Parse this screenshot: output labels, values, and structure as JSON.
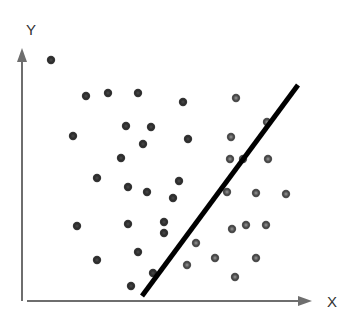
{
  "chart_data": {
    "type": "scatter",
    "title": "",
    "xlabel": "X",
    "ylabel": "Y",
    "grid": false,
    "legend": null,
    "colors": {
      "axis": "#6e6e6e",
      "point_class_a": "#2e2e2e",
      "point_class_b": "#4a4a4a",
      "separator_line": "#000000"
    },
    "series": [
      {
        "name": "class-a (left of line)",
        "points_px": [
          [
            51,
            60
          ],
          [
            86,
            96
          ],
          [
            108,
            93
          ],
          [
            138,
            93
          ],
          [
            183,
            102
          ],
          [
            73,
            136
          ],
          [
            126,
            126
          ],
          [
            151,
            127
          ],
          [
            188,
            139
          ],
          [
            143,
            144
          ],
          [
            121,
            158
          ],
          [
            97,
            178
          ],
          [
            128,
            187
          ],
          [
            147,
            192
          ],
          [
            179,
            181
          ],
          [
            173,
            198
          ],
          [
            77,
            226
          ],
          [
            128,
            224
          ],
          [
            164,
            222
          ],
          [
            164,
            233
          ],
          [
            97,
            260
          ],
          [
            138,
            252
          ],
          [
            153,
            273
          ],
          [
            131,
            286
          ]
        ]
      },
      {
        "name": "class-b (right of line)",
        "points_px": [
          [
            236,
            98
          ],
          [
            267,
            122
          ],
          [
            231,
            137
          ],
          [
            230,
            159
          ],
          [
            243,
            159
          ],
          [
            268,
            159
          ],
          [
            227,
            192
          ],
          [
            256,
            193
          ],
          [
            286,
            194
          ],
          [
            232,
            229
          ],
          [
            246,
            225
          ],
          [
            266,
            225
          ],
          [
            196,
            243
          ],
          [
            187,
            265
          ],
          [
            215,
            258
          ],
          [
            256,
            258
          ],
          [
            235,
            277
          ]
        ]
      }
    ],
    "separator_line_px": {
      "x1": 142,
      "y1": 296,
      "x2": 298,
      "y2": 85
    }
  },
  "axes": {
    "x_label": "X",
    "y_label": "Y"
  }
}
